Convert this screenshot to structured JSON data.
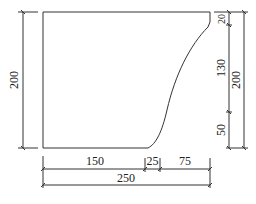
{
  "diagram": {
    "type": "dimensioned-shape-drawing",
    "colors": {
      "line": "#333333",
      "background": "#ffffff"
    },
    "dimensions": {
      "left_height": "200",
      "right_top_segment": "20",
      "right_middle_segment": "130",
      "right_bottom_segment": "50",
      "right_total_height": "200",
      "bottom_left_segment": "150",
      "bottom_middle_segment": "25",
      "bottom_right_segment": "75",
      "bottom_total_width": "250"
    }
  }
}
